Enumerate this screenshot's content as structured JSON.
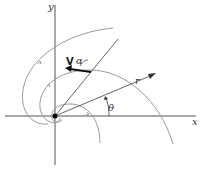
{
  "figure": {
    "type": "logarithmic-spiral polar coordinate diagram",
    "labels": {
      "x_axis": "x",
      "y_axis": "y",
      "radius": "r",
      "angle_theta": "θ",
      "velocity": "V",
      "angle_alpha": "α"
    },
    "colors": {
      "axes": "#555555",
      "spiral": "#9a9a9a",
      "arrow": "#111111",
      "origin_dot": "#000000"
    }
  }
}
